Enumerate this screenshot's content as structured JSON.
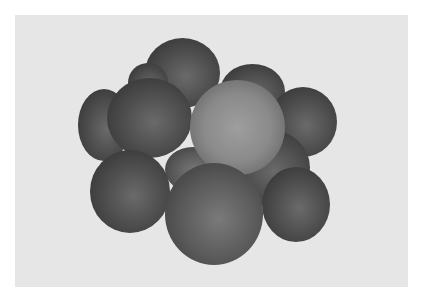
{
  "image": {
    "subject": "pile of citrus fruits (tangerines/oranges) on light gray background",
    "style": "grayscale photograph",
    "background_color": "#e6e6e6",
    "border_color": "#ffffff",
    "fruit_count": 11
  }
}
